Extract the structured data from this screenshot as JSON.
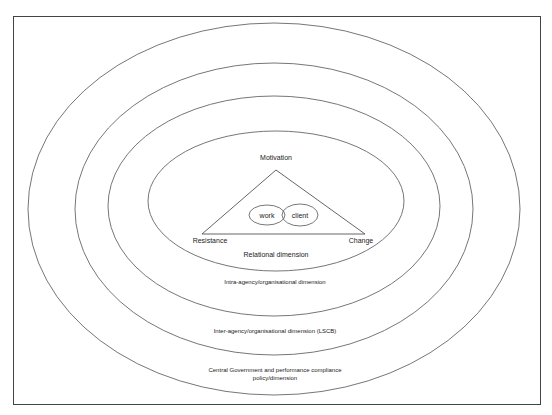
{
  "diagram": {
    "type": "concentric-ellipses",
    "center_labels": {
      "top": "Motivation",
      "left": "Resistance",
      "right": "Change",
      "inner_left": "work",
      "inner_right": "client"
    },
    "rings": [
      {
        "level": 1,
        "label": "Relational dimension"
      },
      {
        "level": 2,
        "label": "Intra-agency/organisational dimension"
      },
      {
        "level": 3,
        "label": "Inter-agency/organisational dimension (LSCB)"
      },
      {
        "level": 4,
        "label_line1": "Central Government and performance compliance",
        "label_line2": "policy/dimension"
      }
    ],
    "colors": {
      "line": "#555555",
      "frame": "#444444",
      "text": "#222222"
    }
  }
}
